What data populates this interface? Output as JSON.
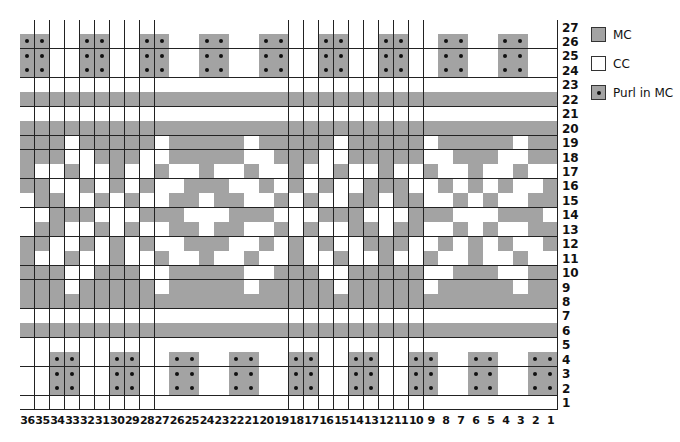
{
  "chart_data": {
    "type": "table",
    "title": "",
    "columns": 36,
    "rows_count": 27,
    "column_labels": [
      "36",
      "35",
      "34",
      "33",
      "32",
      "31",
      "30",
      "29",
      "28",
      "27",
      "26",
      "25",
      "24",
      "23",
      "22",
      "21",
      "20",
      "19",
      "18",
      "17",
      "16",
      "15",
      "14",
      "13",
      "12",
      "11",
      "10",
      "9",
      "8",
      "7",
      "6",
      "5",
      "4",
      "3",
      "2",
      "1"
    ],
    "row_labels_top_to_bottom": [
      "27",
      "26",
      "25",
      "24",
      "23",
      "22",
      "21",
      "20",
      "19",
      "18",
      "17",
      "16",
      "15",
      "14",
      "13",
      "12",
      "11",
      "10",
      "9",
      "8",
      "7",
      "6",
      "5",
      "4",
      "3",
      "2",
      "1"
    ],
    "rows_top_to_bottom": [
      "WWWWWWWWWWWWWWWWWWWWWWWWWWWWWWWWWWWW",
      "PPWWPPWWPPWWPPWWPPWWPPWWPPWWPPWWPPWW",
      "PPWWPPWWPPWWPPWWPPWWPPWWPPWWPPWWPPWW",
      "PPWWPPWWPPWWPPWWPPWWPPWWPPWWPPWWPPWW",
      "WWWWWWWWWWWWWWWWWWWWWWWWWWWWWWWWWWWW",
      "GGGGGGGGGGGGGGGGGGGGGGGGGGGGGGGGGGGG",
      "WWWWWWWWWWWWWWWWWWWWWWWWWWWWWWWWWWWW",
      "GGGGGGGGGGGGGGGGGGGGGGGGGGGGGGGGGGGG",
      "GGGWGGGGGWGGGGGWGGGGGWGGGGGWGGGGGWGG",
      "GGGWWGGGWWGGGGGWWGGGWWGGGGGWWGGGWWGG",
      "GWWGWWGWWGWWGWWGWWGWWGWWGWWGWWGWWGWW",
      "GGWWGWGWGWWGGGWWGWGWGWWGGGWWGWGWGWWG",
      "WGGWWGWGWWGGWGGWWGWGWWGGWGGWWGWGWWGG",
      "WWGGGWWWGGGWWWGGGWWWGGGWWWGGGWWWGGGW",
      "WGGWWGWGWWGGWGGWWGWGWWGGWGGWWGWGWWGG",
      "GGWWGWGWGWWGGGWWGWGWGWWGGGWWGWGWGWWG",
      "GWWGWWGWWGWWGWWGWWGWWGWWGWWGWWGWWGWW",
      "GGGWWGGGWWGGGGGWWGGGWWGGGGGWWGGGWWGG",
      "GGGWGGGGGWGGGGGWGGGGGWGGGGGWGGGGGWGG",
      "GGGGGGGGGGGGGGGGGGGGGGGGGGGGGGGGGGGG",
      "WWWWWWWWWWWWWWWWWWWWWWWWWWWWWWWWWWWW",
      "GGGGGGGGGGGGGGGGGGGGGGGGGGGGGGGGGGGG",
      "WWWWWWWWWWWWWWWWWWWWWWWWWWWWWWWWWWWW",
      "WWPPWWPPWWPPWWPPWWPPWWPPWWPPWWPPWWPP",
      "WWPPWWPPWWPPWWPPWWPPWWPPWWPPWWPPWWPP",
      "WWPPWWPPWWPPWWPPWWPPWWPPWWPPWWPPWWPP",
      "WWWWWWWWWWWWWWWWWWWWWWWWWWWWWWWWWWWW"
    ],
    "legend": [
      {
        "code": "G",
        "label": "MC",
        "color": "#a3a3a3"
      },
      {
        "code": "W",
        "label": "CC",
        "color": "#ffffff"
      },
      {
        "code": "P",
        "label": "Purl in MC",
        "color": "#a3a3a3",
        "mark": "dot"
      }
    ]
  },
  "legend": {
    "mc": "MC",
    "cc": "CC",
    "purl": "Purl in MC"
  },
  "colors": {
    "mc": "#a3a3a3",
    "cc": "#ffffff",
    "grid_line": "#222222"
  }
}
